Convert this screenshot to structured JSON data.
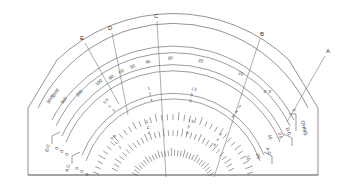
{
  "figure": {
    "background": "#ffffff",
    "ink": "#4a4a52"
  },
  "callouts": [
    {
      "id": "E",
      "label": "E",
      "lx": 82,
      "ly": 39,
      "x1": 85,
      "y1": 43,
      "x2": 119,
      "y2": 104
    },
    {
      "id": "D",
      "label": "D",
      "lx": 110,
      "ly": 29,
      "x1": 112,
      "y1": 33,
      "x2": 128,
      "y2": 115
    },
    {
      "id": "C",
      "label": "C",
      "lx": 156,
      "ly": 17,
      "x1": 157,
      "y1": 21,
      "x2": 166,
      "y2": 177
    },
    {
      "id": "B",
      "label": "B",
      "lx": 262,
      "ly": 35,
      "x1": 260,
      "y1": 39,
      "x2": 214,
      "y2": 177
    },
    {
      "id": "A",
      "label": "A",
      "lx": 328,
      "ly": 52,
      "x1": 325,
      "y1": 56,
      "x2": 287,
      "y2": 122
    }
  ],
  "scales": {
    "ohms": {
      "name": "OHMS",
      "unit_label": "OHMS",
      "zero_label": "0",
      "major_labels": [
        "3000",
        "1000",
        "500",
        "200",
        "100",
        "80",
        "60",
        "50",
        "40",
        "30",
        "20",
        "10",
        "5",
        "0"
      ],
      "direction": "right-to-left increasing"
    },
    "voltage_upper": {
      "name": "upper voltage scale",
      "multiplier_groups": [
        {
          "values": [
            "0.5",
            "1",
            "2"
          ]
        },
        {
          "values": [
            "1",
            "2",
            "4"
          ]
        },
        {
          "values": [
            "1.5",
            "3",
            "6"
          ]
        },
        {
          "values": [
            "2",
            "4",
            "8"
          ]
        },
        {
          "values": [
            "5"
          ]
        }
      ],
      "end_left": {
        "label": "D.C",
        "values": [
          "0",
          "0",
          "0"
        ]
      },
      "end_right": {
        "label": "D.C",
        "values": [
          "2.5",
          "10",
          "25"
        ]
      }
    },
    "voltage_lower": {
      "name": "lower voltage scale",
      "multiplier_groups": [
        {
          "values": [
            "0.8",
            "1",
            "2"
          ]
        },
        {
          "values": [
            "1",
            "2",
            "4"
          ]
        },
        {
          "values": [
            "1.5",
            "3",
            "6"
          ]
        },
        {
          "values": [
            "2",
            "4",
            "8"
          ]
        }
      ],
      "end_left": {
        "label": "A.C",
        "values": [
          "0",
          "0",
          "0"
        ]
      },
      "end_right": {
        "label": "A.C",
        "values": [
          "10",
          "25"
        ]
      }
    }
  },
  "ohms_ticks_labeled": [
    {
      "label": "3000"
    },
    {
      "label": "1000"
    },
    {
      "label": "500"
    },
    {
      "label": "200"
    },
    {
      "label": "100"
    },
    {
      "label": "80"
    },
    {
      "label": "60"
    },
    {
      "label": "50"
    },
    {
      "label": "40"
    },
    {
      "label": "30"
    },
    {
      "label": "20"
    },
    {
      "label": "10"
    },
    {
      "label": "5"
    },
    {
      "label": "0"
    }
  ]
}
